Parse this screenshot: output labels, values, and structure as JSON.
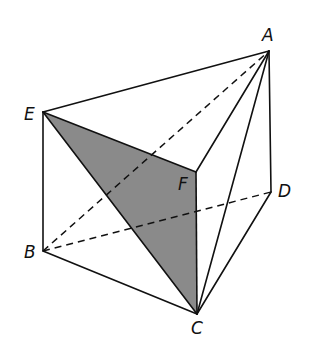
{
  "diagram": {
    "type": "3d-geometry-solid",
    "vertices": {
      "A": {
        "label": "A",
        "x": 269,
        "y": 51,
        "label_x": 262,
        "label_y": 41
      },
      "B": {
        "label": "B",
        "x": 43,
        "y": 251,
        "label_x": 24,
        "label_y": 258
      },
      "C": {
        "label": "C",
        "x": 197,
        "y": 314,
        "label_x": 191,
        "label_y": 334
      },
      "D": {
        "label": "D",
        "x": 271,
        "y": 192,
        "label_x": 278,
        "label_y": 197
      },
      "E": {
        "label": "E",
        "x": 43,
        "y": 112,
        "label_x": 24,
        "label_y": 120
      },
      "F": {
        "label": "F",
        "x": 196,
        "y": 172,
        "label_x": 178,
        "label_y": 190
      }
    },
    "solid_edges": [
      [
        "E",
        "A"
      ],
      [
        "A",
        "D"
      ],
      [
        "E",
        "B"
      ],
      [
        "B",
        "C"
      ],
      [
        "C",
        "D"
      ],
      [
        "E",
        "C"
      ],
      [
        "E",
        "F"
      ],
      [
        "F",
        "C"
      ],
      [
        "F",
        "A"
      ],
      [
        "A",
        "C"
      ]
    ],
    "dashed_edges": [
      [
        "B",
        "A"
      ],
      [
        "B",
        "D"
      ]
    ],
    "shaded_face": [
      "E",
      "F",
      "C"
    ],
    "shade_color": "#8a8a8a",
    "line_color": "#111111"
  }
}
